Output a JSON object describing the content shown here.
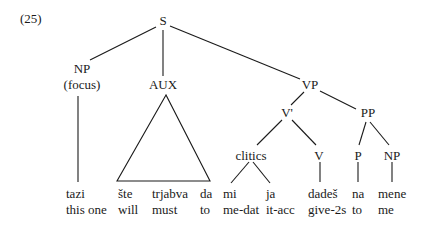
{
  "example_number": "(25)",
  "tree": {
    "root": "S",
    "np_focus": {
      "label": "NP",
      "sublabel": "(focus)"
    },
    "aux": "AUX",
    "vp": "VP",
    "v_bar": "V'",
    "pp": "PP",
    "clitics": "clitics",
    "v": "V",
    "p": "P",
    "np": "NP"
  },
  "words": [
    {
      "form": "tazi",
      "gloss": "this one"
    },
    {
      "form": "šte",
      "gloss": "will"
    },
    {
      "form": "trjabva",
      "gloss": "must"
    },
    {
      "form": "da",
      "gloss": "to"
    },
    {
      "form": "mi",
      "gloss": "me-dat"
    },
    {
      "form": "ja",
      "gloss": "it-acc"
    },
    {
      "form": "dadeš",
      "gloss": "give-2s"
    },
    {
      "form": "na",
      "gloss": "to"
    },
    {
      "form": "mene",
      "gloss": "me"
    }
  ]
}
